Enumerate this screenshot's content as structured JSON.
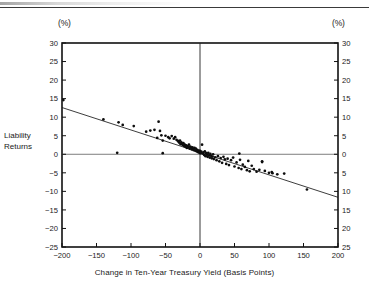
{
  "figure": {
    "unit_label_left": "(%)",
    "unit_label_right": "(%)",
    "y_axis_title_line1": "Liability",
    "y_axis_title_line2": "Returns"
  },
  "chart_data": {
    "type": "scatter",
    "title": "",
    "xlabel": "Change in Ten-Year Treasury Yield (Basis Points)",
    "ylabel": "Liability Returns",
    "y_unit": "(%)",
    "y_unit_right": "(%)",
    "xlim": [
      -200,
      200
    ],
    "ylim": [
      -25,
      30
    ],
    "xticks": [
      -200,
      -150,
      -100,
      -50,
      0,
      50,
      100,
      150,
      200
    ],
    "xticklabels": [
      "−200",
      "−150",
      "−100",
      "−50",
      "0",
      "50",
      "100",
      "150",
      "200"
    ],
    "yticks": [
      -25,
      -20,
      -15,
      -10,
      -5,
      0,
      5,
      10,
      15,
      20,
      25,
      30
    ],
    "yticklabels_left": [
      "−25",
      "−20",
      "−15",
      "−10",
      "−5",
      "0",
      "5",
      "10",
      "15",
      "20",
      "25",
      "30"
    ],
    "yticklabels_right": [
      "25",
      "20",
      "15",
      "10",
      "5",
      "0",
      "5",
      "10",
      "15",
      "20",
      "25",
      "30"
    ],
    "grid": false,
    "legend": null,
    "reference_lines": [
      {
        "name": "zero-horizontal",
        "axis": "y",
        "value": 0
      },
      {
        "name": "zero-vertical",
        "axis": "x",
        "value": 0
      }
    ],
    "trendline": {
      "name": "regression-line",
      "x": [
        -200,
        200
      ],
      "y": [
        12.6,
        -11.6
      ],
      "slope": -0.0605,
      "intercept": 0.5
    },
    "points": [
      [
        -198,
        14.6
      ],
      [
        -140,
        9.4
      ],
      [
        -118,
        8.6
      ],
      [
        -112,
        7.9
      ],
      [
        -96,
        7.6
      ],
      [
        -78,
        6.1
      ],
      [
        -72,
        6.4
      ],
      [
        -66,
        6.6
      ],
      [
        -62,
        4.4
      ],
      [
        -60,
        8.8
      ],
      [
        -58,
        6.3
      ],
      [
        -56,
        5.1
      ],
      [
        -54,
        3.7
      ],
      [
        -50,
        5.0
      ],
      [
        -46,
        4.6
      ],
      [
        -44,
        4.3
      ],
      [
        -41,
        4.9
      ],
      [
        -38,
        4.2
      ],
      [
        -36,
        4.6
      ],
      [
        -34,
        3.9
      ],
      [
        -32,
        3.6
      ],
      [
        -31,
        3.4
      ],
      [
        -30,
        3.1
      ],
      [
        -29,
        3.7
      ],
      [
        -28,
        2.7
      ],
      [
        -27,
        3.2
      ],
      [
        -26,
        2.9
      ],
      [
        -25,
        2.5
      ],
      [
        -24,
        3.0
      ],
      [
        -23,
        2.2
      ],
      [
        -22,
        2.6
      ],
      [
        -21,
        2.0
      ],
      [
        -20,
        2.4
      ],
      [
        -19,
        1.7
      ],
      [
        -18,
        2.2
      ],
      [
        -17,
        1.9
      ],
      [
        -16,
        2.6
      ],
      [
        -15,
        1.5
      ],
      [
        -14,
        2.1
      ],
      [
        -13,
        1.8
      ],
      [
        -12,
        1.3
      ],
      [
        -11,
        1.9
      ],
      [
        -10,
        1.4
      ],
      [
        -9,
        1.1
      ],
      [
        -8,
        1.7
      ],
      [
        -7,
        1.0
      ],
      [
        -6,
        1.5
      ],
      [
        -5,
        0.8
      ],
      [
        -4,
        1.2
      ],
      [
        -3,
        0.6
      ],
      [
        -2,
        1.0
      ],
      [
        -1,
        0.4
      ],
      [
        0,
        0.9
      ],
      [
        1,
        0.3
      ],
      [
        2,
        0.7
      ],
      [
        3,
        2.6
      ],
      [
        4,
        0.2
      ],
      [
        5,
        0.5
      ],
      [
        6,
        -0.2
      ],
      [
        7,
        0.8
      ],
      [
        8,
        -0.5
      ],
      [
        9,
        0.3
      ],
      [
        10,
        -0.1
      ],
      [
        11,
        -0.7
      ],
      [
        12,
        0.4
      ],
      [
        13,
        -0.3
      ],
      [
        14,
        -0.9
      ],
      [
        15,
        0.1
      ],
      [
        16,
        -0.4
      ],
      [
        17,
        -1.1
      ],
      [
        18,
        -0.6
      ],
      [
        19,
        0.0
      ],
      [
        20,
        -1.3
      ],
      [
        22,
        -0.8
      ],
      [
        24,
        -1.6
      ],
      [
        26,
        -0.5
      ],
      [
        28,
        -1.9
      ],
      [
        30,
        -1.0
      ],
      [
        32,
        -2.3
      ],
      [
        34,
        -0.7
      ],
      [
        36,
        -1.4
      ],
      [
        38,
        -2.6
      ],
      [
        40,
        -1.2
      ],
      [
        42,
        -2.9
      ],
      [
        45,
        -1.6
      ],
      [
        48,
        -0.9
      ],
      [
        50,
        -3.3
      ],
      [
        53,
        -2.2
      ],
      [
        56,
        -3.7
      ],
      [
        58,
        -1.5
      ],
      [
        60,
        -4.0
      ],
      [
        62,
        -2.8
      ],
      [
        65,
        -3.4
      ],
      [
        68,
        -4.3
      ],
      [
        70,
        -1.8
      ],
      [
        72,
        -4.6
      ],
      [
        75,
        -3.1
      ],
      [
        78,
        -4.0
      ],
      [
        82,
        -4.7
      ],
      [
        86,
        -4.2
      ],
      [
        90,
        -2.1
      ],
      [
        94,
        -4.5
      ],
      [
        100,
        -5.0
      ],
      [
        104,
        -4.8
      ],
      [
        112,
        -5.4
      ],
      [
        122,
        -5.2
      ],
      [
        155,
        -9.5
      ],
      [
        -54,
        0.3
      ],
      [
        -120,
        0.4
      ],
      [
        57,
        0.2
      ],
      [
        90,
        -1.9
      ],
      [
        105,
        -5.1
      ]
    ]
  }
}
